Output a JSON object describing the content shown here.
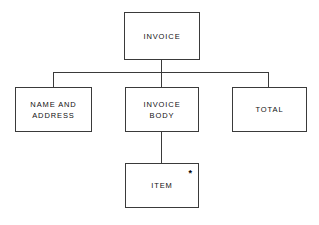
{
  "diagram": {
    "background_color": "#ffffff",
    "line_color": "#3a3a3a",
    "text_color": "#111111",
    "nodes": [
      {
        "id": "invoice",
        "label_line1": "INVOICE",
        "label_line2": "",
        "x": 124,
        "y": 12,
        "w": 76,
        "h": 48
      },
      {
        "id": "name-and-address",
        "label_line1": "NAME AND",
        "label_line2": "ADDRESS",
        "x": 15,
        "y": 87,
        "w": 77,
        "h": 45
      },
      {
        "id": "invoice-body",
        "label_line1": "INVOICE",
        "label_line2": "BODY",
        "x": 125,
        "y": 87,
        "w": 74,
        "h": 45
      },
      {
        "id": "total",
        "label_line1": "TOTAL",
        "label_line2": "",
        "x": 232,
        "y": 87,
        "w": 75,
        "h": 45
      },
      {
        "id": "item",
        "label_line1": "ITEM",
        "label_line2": "",
        "x": 125,
        "y": 163,
        "w": 74,
        "h": 45,
        "mark": "*"
      }
    ]
  }
}
